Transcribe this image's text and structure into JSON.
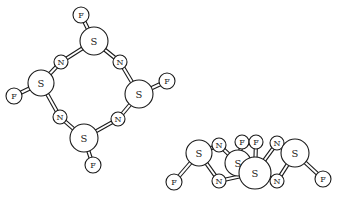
{
  "figure": {
    "colors": {
      "stroke": "#1a1a1a",
      "fill": "#ffffff"
    }
  },
  "molecules": [
    {
      "name": "top-view",
      "atoms": [
        {
          "id": "F1",
          "el": "F",
          "x": 81,
          "y": 15,
          "r": 8
        },
        {
          "id": "S1",
          "el": "S",
          "x": 94,
          "y": 41,
          "r": 14
        },
        {
          "id": "N1",
          "el": "N",
          "x": 61,
          "y": 62,
          "r": 7
        },
        {
          "id": "N2",
          "el": "N",
          "x": 120,
          "y": 62,
          "r": 7
        },
        {
          "id": "S2",
          "el": "S",
          "x": 41,
          "y": 83,
          "r": 13
        },
        {
          "id": "F2",
          "el": "F",
          "x": 14,
          "y": 96,
          "r": 8
        },
        {
          "id": "S3",
          "el": "S",
          "x": 139,
          "y": 94,
          "r": 14
        },
        {
          "id": "F3",
          "el": "F",
          "x": 167,
          "y": 81,
          "r": 8
        },
        {
          "id": "N3",
          "el": "N",
          "x": 60,
          "y": 117,
          "r": 7
        },
        {
          "id": "N4",
          "el": "N",
          "x": 118,
          "y": 119,
          "r": 7
        },
        {
          "id": "S4",
          "el": "S",
          "x": 84,
          "y": 138,
          "r": 14
        },
        {
          "id": "F4",
          "el": "F",
          "x": 93,
          "y": 165,
          "r": 8
        }
      ],
      "bonds": [
        [
          "F1",
          "S1"
        ],
        [
          "S1",
          "N1"
        ],
        [
          "S1",
          "N2"
        ],
        [
          "N1",
          "S2"
        ],
        [
          "S2",
          "F2"
        ],
        [
          "N2",
          "S3"
        ],
        [
          "S3",
          "F3"
        ],
        [
          "S2",
          "N3"
        ],
        [
          "S3",
          "N4"
        ],
        [
          "N3",
          "S4"
        ],
        [
          "N4",
          "S4"
        ],
        [
          "S4",
          "F4"
        ]
      ]
    },
    {
      "name": "side-view",
      "atoms": [
        {
          "id": "S5",
          "el": "S",
          "x": 238,
          "y": 163,
          "r": 13
        },
        {
          "id": "F5",
          "el": "F",
          "x": 174,
          "y": 182,
          "r": 8
        },
        {
          "id": "S6",
          "el": "S",
          "x": 199,
          "y": 153,
          "r": 13
        },
        {
          "id": "N5",
          "el": "N",
          "x": 219,
          "y": 145,
          "r": 7
        },
        {
          "id": "N6",
          "el": "N",
          "x": 219,
          "y": 181,
          "r": 7
        },
        {
          "id": "F6",
          "el": "F",
          "x": 242,
          "y": 142,
          "r": 7
        },
        {
          "id": "F7",
          "el": "F",
          "x": 256,
          "y": 142,
          "r": 7
        },
        {
          "id": "N7",
          "el": "N",
          "x": 277,
          "y": 143,
          "r": 7
        },
        {
          "id": "N8",
          "el": "N",
          "x": 277,
          "y": 181,
          "r": 7
        },
        {
          "id": "S7",
          "el": "S",
          "x": 255,
          "y": 173,
          "r": 16
        },
        {
          "id": "S8",
          "el": "S",
          "x": 295,
          "y": 153,
          "r": 14
        },
        {
          "id": "F8",
          "el": "F",
          "x": 323,
          "y": 179,
          "r": 8
        }
      ],
      "bonds": [
        [
          "S6",
          "F5"
        ],
        [
          "S6",
          "N5"
        ],
        [
          "S6",
          "N6"
        ],
        [
          "N5",
          "S5"
        ],
        [
          "N6",
          "S7"
        ],
        [
          "S5",
          "F6"
        ],
        [
          "S7",
          "F7"
        ],
        [
          "S7",
          "N7"
        ],
        [
          "N7",
          "S8"
        ],
        [
          "S8",
          "N8"
        ],
        [
          "N8",
          "S5"
        ],
        [
          "S8",
          "F8"
        ]
      ]
    }
  ]
}
